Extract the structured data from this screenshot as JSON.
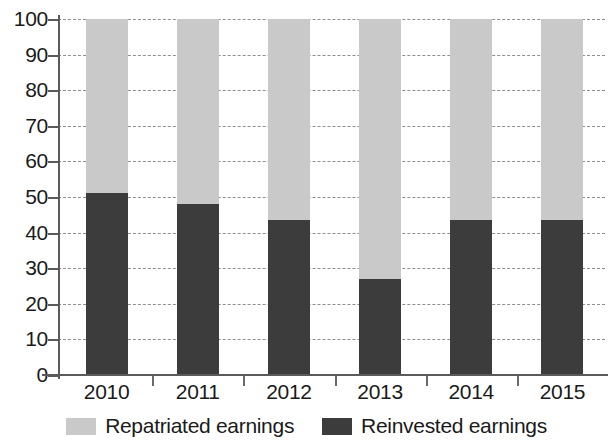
{
  "chart_data": {
    "type": "bar",
    "subtype": "stacked-100-percent",
    "title": "",
    "subtitle": "",
    "xlabel": "",
    "ylabel": "",
    "categories": [
      "2010",
      "2011",
      "2012",
      "2013",
      "2014",
      "2015"
    ],
    "series": [
      {
        "name": "Reinvested earnings",
        "color": "#3c3c3c",
        "stack_position": "bottom",
        "values": [
          51,
          48,
          43.5,
          27,
          43.5,
          43.5
        ]
      },
      {
        "name": "Repatriated earnings",
        "color": "#c9c9c9",
        "stack_position": "top",
        "values": [
          49,
          52,
          56.5,
          73,
          56.5,
          56.5
        ]
      }
    ],
    "ylim": [
      0,
      100
    ],
    "ytick_values": [
      0,
      10,
      20,
      30,
      40,
      50,
      60,
      70,
      80,
      90,
      100
    ],
    "ytick_labels": [
      "0",
      "10",
      "20",
      "30",
      "40",
      "50",
      "60",
      "70",
      "80",
      "90",
      "100"
    ],
    "grid": "horizontal-dashed",
    "legend_position": "bottom-center",
    "legend_entries": [
      {
        "label": "Repatriated earnings",
        "color": "#c9c9c9",
        "swatch": "light-gray-swatch"
      },
      {
        "label": "Reinvested earnings",
        "color": "#3c3c3c",
        "swatch": "dark-gray-swatch"
      }
    ],
    "annotations": []
  }
}
